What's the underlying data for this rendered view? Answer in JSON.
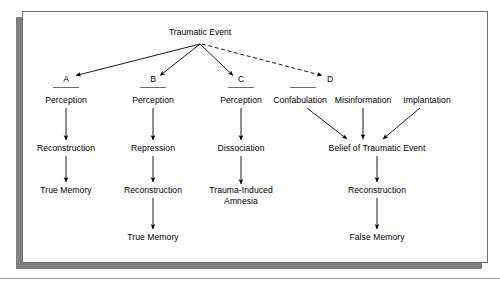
{
  "figure": {
    "root": {
      "label": "Traumatic Event",
      "x": 200,
      "y": 32
    },
    "branch_labels": [
      {
        "id": "A",
        "label": "A",
        "x": 66,
        "y": 79
      },
      {
        "id": "B",
        "label": "B",
        "x": 153,
        "y": 79
      },
      {
        "id": "C",
        "label": "C",
        "x": 241,
        "y": 79
      },
      {
        "id": "D",
        "label": "D",
        "x": 330,
        "y": 79
      }
    ],
    "nodes": [
      {
        "id": "a-perception",
        "label": "Perception",
        "x": 66,
        "y": 100
      },
      {
        "id": "a-reconstruction",
        "label": "Reconstruction",
        "x": 66,
        "y": 148
      },
      {
        "id": "a-true-memory",
        "label": "True Memory",
        "x": 66,
        "y": 190
      },
      {
        "id": "b-perception",
        "label": "Perception",
        "x": 153,
        "y": 100
      },
      {
        "id": "b-repression",
        "label": "Repression",
        "x": 153,
        "y": 148
      },
      {
        "id": "b-reconstruction",
        "label": "Reconstruction",
        "x": 153,
        "y": 190
      },
      {
        "id": "b-true-memory",
        "label": "True Memory",
        "x": 153,
        "y": 237
      },
      {
        "id": "c-perception",
        "label": "Perception",
        "x": 241,
        "y": 100
      },
      {
        "id": "c-dissociation",
        "label": "Dissociation",
        "x": 241,
        "y": 148
      },
      {
        "id": "c-amnesia",
        "label": "Trauma-Induced Amnesia",
        "x": 241,
        "y": 196,
        "two_line": true
      },
      {
        "id": "d-confabulation",
        "label": "Confabulation",
        "x": 300,
        "y": 100
      },
      {
        "id": "d-misinformation",
        "label": "Misinformation",
        "x": 363,
        "y": 100
      },
      {
        "id": "d-implantation",
        "label": "Implantation",
        "x": 427,
        "y": 100
      },
      {
        "id": "d-belief",
        "label": "Belief of Traumatic Event",
        "x": 377,
        "y": 148
      },
      {
        "id": "d-reconstruction",
        "label": "Reconstruction",
        "x": 377,
        "y": 190
      },
      {
        "id": "d-false-memory",
        "label": "False Memory",
        "x": 377,
        "y": 237
      }
    ],
    "edges": [
      {
        "id": "root-to-a",
        "from": "Traumatic Event",
        "to": "A",
        "style": "solid"
      },
      {
        "id": "root-to-b",
        "from": "Traumatic Event",
        "to": "B",
        "style": "solid"
      },
      {
        "id": "root-to-c",
        "from": "Traumatic Event",
        "to": "C",
        "style": "solid"
      },
      {
        "id": "root-to-d",
        "from": "Traumatic Event",
        "to": "D",
        "style": "dashed"
      },
      {
        "id": "a1",
        "from": "Perception",
        "to": "Reconstruction",
        "style": "solid"
      },
      {
        "id": "a2",
        "from": "Reconstruction",
        "to": "True Memory",
        "style": "solid"
      },
      {
        "id": "b1",
        "from": "Perception",
        "to": "Repression",
        "style": "solid"
      },
      {
        "id": "b2",
        "from": "Repression",
        "to": "Reconstruction",
        "style": "solid"
      },
      {
        "id": "b3",
        "from": "Reconstruction",
        "to": "True Memory",
        "style": "solid"
      },
      {
        "id": "c1",
        "from": "Perception",
        "to": "Dissociation",
        "style": "solid"
      },
      {
        "id": "c2",
        "from": "Dissociation",
        "to": "Trauma-Induced Amnesia",
        "style": "solid"
      },
      {
        "id": "d1",
        "from": "Confabulation",
        "to": "Belief of Traumatic Event",
        "style": "solid"
      },
      {
        "id": "d2",
        "from": "Misinformation",
        "to": "Belief of Traumatic Event",
        "style": "solid"
      },
      {
        "id": "d3",
        "from": "Implantation",
        "to": "Belief of Traumatic Event",
        "style": "solid"
      },
      {
        "id": "d4",
        "from": "Belief of Traumatic Event",
        "to": "Reconstruction",
        "style": "solid"
      },
      {
        "id": "d5",
        "from": "Reconstruction",
        "to": "False Memory",
        "style": "solid"
      }
    ],
    "colors": {
      "line": "#000000",
      "frame": "#6e6e6e",
      "shadow": "#7f7f7f",
      "background": "#ffffff",
      "text": "#000000",
      "underline": "#6a6a6a"
    }
  }
}
